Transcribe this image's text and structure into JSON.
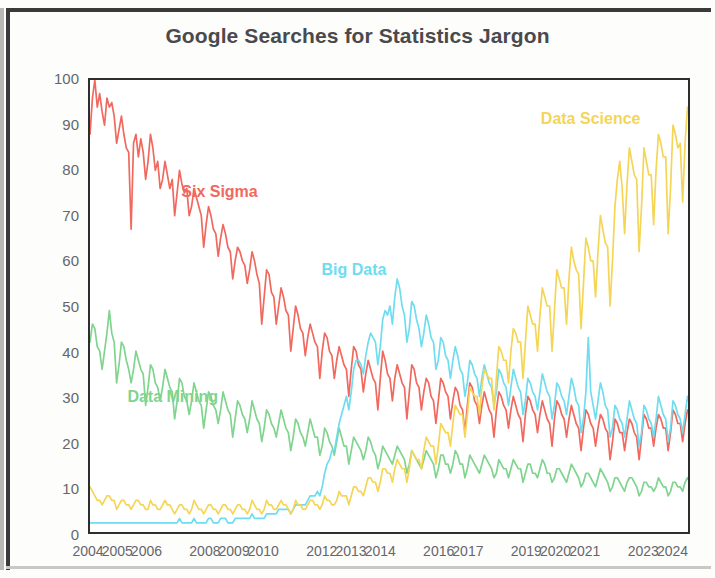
{
  "chart_data": {
    "type": "line",
    "title": "Google Searches for Statistics Jargon",
    "xlabel": "",
    "ylabel": "Estimated Number of Searches in U.S.",
    "ylim": [
      0,
      100
    ],
    "xlim": [
      2004,
      2024.6
    ],
    "grid": false,
    "legend_position": "inline-annotations",
    "y_ticks": [
      0,
      10,
      20,
      30,
      40,
      50,
      60,
      70,
      80,
      90,
      100
    ],
    "x_ticks": [
      2004,
      2005,
      2006,
      2008,
      2009,
      2010,
      2012,
      2013,
      2014,
      2016,
      2017,
      2019,
      2020,
      2021,
      2023,
      2024
    ],
    "x_tick_labels": [
      "2004",
      "2005",
      "2006",
      "2008",
      "2009",
      "2010",
      "2012",
      "2013",
      "2014",
      "2016",
      "2017",
      "2019",
      "2020",
      "2021",
      "2023",
      "2024"
    ],
    "sample_interval": "monthly",
    "x_start": 2004.0,
    "x_step": 0.08333,
    "series": [
      {
        "name": "Six Sigma",
        "color": "#f0685e",
        "label_x": 2008.5,
        "label_y": 75,
        "values": [
          88,
          96,
          100,
          94,
          97,
          93,
          90,
          96,
          94,
          95,
          92,
          86,
          89,
          92,
          88,
          85,
          84,
          67,
          86,
          88,
          83,
          87,
          84,
          78,
          82,
          88,
          85,
          80,
          82,
          76,
          78,
          82,
          79,
          76,
          78,
          70,
          75,
          80,
          77,
          75,
          76,
          70,
          72,
          76,
          74,
          72,
          70,
          63,
          68,
          72,
          70,
          67,
          66,
          61,
          65,
          68,
          66,
          63,
          62,
          56,
          60,
          63,
          62,
          60,
          59,
          55,
          58,
          62,
          60,
          57,
          55,
          46,
          52,
          58,
          57,
          53,
          52,
          46,
          50,
          54,
          52,
          49,
          48,
          40,
          45,
          50,
          48,
          45,
          44,
          39,
          43,
          46,
          44,
          42,
          41,
          34,
          40,
          44,
          43,
          40,
          39,
          34,
          38,
          41,
          39,
          37,
          36,
          30,
          36,
          41,
          40,
          37,
          36,
          31,
          35,
          38,
          36,
          34,
          33,
          27,
          34,
          40,
          38,
          35,
          34,
          29,
          34,
          37,
          35,
          33,
          32,
          25,
          31,
          37,
          36,
          33,
          32,
          27,
          31,
          34,
          33,
          30,
          29,
          24,
          29,
          34,
          33,
          31,
          30,
          25,
          29,
          32,
          31,
          28,
          27,
          22,
          28,
          33,
          32,
          29,
          28,
          24,
          28,
          31,
          29,
          27,
          26,
          21,
          27,
          31,
          30,
          28,
          27,
          23,
          27,
          30,
          28,
          26,
          25,
          20,
          26,
          30,
          29,
          27,
          26,
          22,
          26,
          29,
          27,
          25,
          24,
          19,
          25,
          29,
          28,
          26,
          25,
          21,
          25,
          28,
          26,
          24,
          23,
          18,
          23,
          27,
          26,
          24,
          23,
          19,
          23,
          26,
          25,
          23,
          22,
          16,
          20,
          25,
          24,
          22,
          22,
          18,
          22,
          25,
          24,
          22,
          21,
          16,
          21,
          26,
          25,
          23,
          23,
          19,
          23,
          26,
          25,
          23,
          23,
          18,
          22,
          27,
          26,
          24,
          24,
          20,
          24,
          27,
          26,
          24,
          25,
          25
        ]
      },
      {
        "name": "Data Mining",
        "color": "#7fd48e",
        "label_x": 2006.9,
        "label_y": 30,
        "values": [
          42,
          46,
          45,
          41,
          40,
          36,
          40,
          44,
          49,
          44,
          42,
          33,
          37,
          42,
          41,
          38,
          36,
          33,
          36,
          40,
          38,
          36,
          35,
          28,
          32,
          37,
          36,
          33,
          32,
          29,
          32,
          36,
          34,
          32,
          31,
          25,
          29,
          34,
          33,
          30,
          29,
          26,
          29,
          33,
          31,
          29,
          28,
          23,
          27,
          31,
          30,
          28,
          27,
          24,
          27,
          31,
          29,
          27,
          26,
          21,
          25,
          29,
          28,
          26,
          25,
          22,
          25,
          29,
          27,
          25,
          24,
          20,
          23,
          27,
          26,
          24,
          23,
          21,
          24,
          27,
          25,
          23,
          22,
          18,
          21,
          25,
          24,
          22,
          21,
          19,
          22,
          25,
          23,
          21,
          21,
          17,
          19,
          23,
          22,
          20,
          19,
          17,
          20,
          23,
          21,
          19,
          19,
          15,
          18,
          21,
          20,
          19,
          18,
          16,
          18,
          21,
          20,
          18,
          17,
          14,
          16,
          19,
          18,
          17,
          16,
          15,
          17,
          19,
          18,
          17,
          16,
          13,
          15,
          18,
          17,
          16,
          15,
          14,
          16,
          18,
          17,
          16,
          15,
          12,
          14,
          17,
          17,
          15,
          15,
          13,
          15,
          18,
          17,
          15,
          15,
          12,
          14,
          17,
          16,
          15,
          14,
          13,
          15,
          17,
          16,
          15,
          14,
          12,
          13,
          16,
          15,
          14,
          14,
          12,
          14,
          16,
          15,
          14,
          14,
          11,
          13,
          15,
          15,
          13,
          13,
          12,
          14,
          16,
          15,
          13,
          13,
          11,
          12,
          14,
          14,
          13,
          12,
          11,
          13,
          15,
          14,
          13,
          12,
          10,
          11,
          13,
          13,
          12,
          11,
          10,
          12,
          14,
          13,
          12,
          11,
          9,
          10,
          12,
          12,
          11,
          10,
          9,
          11,
          12,
          12,
          11,
          10,
          8,
          9,
          11,
          11,
          10,
          10,
          9,
          10,
          12,
          11,
          10,
          10,
          8,
          9,
          11,
          11,
          10,
          10,
          9,
          11,
          12,
          11,
          10,
          10,
          10
        ]
      },
      {
        "name": "Big Data",
        "color": "#6fdcf0",
        "label_x": 2013.1,
        "label_y": 58,
        "values": [
          2,
          2,
          2,
          2,
          2,
          2,
          2,
          2,
          2,
          2,
          2,
          2,
          2,
          2,
          2,
          2,
          2,
          2,
          2,
          2,
          2,
          2,
          2,
          2,
          2,
          2,
          2,
          2,
          2,
          2,
          2,
          2,
          2,
          2,
          2,
          2,
          2,
          3,
          2,
          2,
          2,
          2,
          2,
          3,
          2,
          2,
          2,
          2,
          2,
          3,
          3,
          2,
          2,
          2,
          3,
          3,
          3,
          2,
          2,
          2,
          3,
          3,
          3,
          3,
          3,
          3,
          3,
          4,
          3,
          3,
          3,
          3,
          3,
          4,
          4,
          4,
          4,
          4,
          5,
          5,
          5,
          5,
          5,
          4,
          5,
          6,
          6,
          6,
          6,
          6,
          7,
          8,
          8,
          8,
          9,
          8,
          10,
          13,
          15,
          16,
          18,
          18,
          21,
          24,
          26,
          28,
          30,
          27,
          31,
          36,
          38,
          38,
          37,
          35,
          39,
          42,
          44,
          43,
          42,
          37,
          41,
          47,
          49,
          48,
          50,
          46,
          52,
          56,
          54,
          50,
          48,
          42,
          45,
          51,
          50,
          47,
          45,
          41,
          44,
          48,
          46,
          43,
          42,
          36,
          38,
          43,
          42,
          39,
          38,
          34,
          38,
          41,
          39,
          36,
          35,
          30,
          33,
          38,
          37,
          35,
          34,
          30,
          34,
          37,
          35,
          33,
          32,
          28,
          31,
          36,
          35,
          33,
          32,
          28,
          32,
          36,
          34,
          32,
          31,
          26,
          29,
          34,
          33,
          31,
          30,
          27,
          31,
          35,
          33,
          31,
          30,
          25,
          28,
          33,
          32,
          30,
          29,
          26,
          30,
          34,
          32,
          29,
          28,
          22,
          25,
          31,
          43,
          31,
          28,
          25,
          29,
          33,
          31,
          28,
          27,
          21,
          23,
          28,
          27,
          25,
          24,
          21,
          25,
          29,
          27,
          25,
          24,
          19,
          22,
          28,
          27,
          25,
          24,
          21,
          25,
          30,
          28,
          26,
          25,
          20,
          23,
          29,
          28,
          26,
          25,
          22,
          26,
          30,
          28,
          26,
          26,
          26
        ]
      },
      {
        "name": "Data Science",
        "color": "#f5d556",
        "label_x": 2021.2,
        "label_y": 91,
        "values": [
          10,
          9,
          8,
          7,
          7,
          6,
          7,
          8,
          8,
          7,
          7,
          5,
          6,
          7,
          7,
          6,
          6,
          5,
          6,
          7,
          7,
          6,
          6,
          5,
          5,
          7,
          6,
          6,
          5,
          5,
          6,
          7,
          6,
          6,
          5,
          4,
          5,
          6,
          6,
          5,
          5,
          4,
          5,
          7,
          6,
          5,
          5,
          4,
          5,
          6,
          6,
          5,
          5,
          4,
          5,
          6,
          6,
          5,
          5,
          4,
          5,
          6,
          6,
          5,
          5,
          4,
          5,
          7,
          6,
          5,
          5,
          4,
          5,
          7,
          6,
          6,
          5,
          5,
          6,
          7,
          6,
          6,
          5,
          4,
          5,
          7,
          6,
          6,
          5,
          5,
          6,
          7,
          7,
          6,
          6,
          5,
          6,
          8,
          7,
          7,
          6,
          6,
          7,
          9,
          8,
          8,
          8,
          6,
          8,
          10,
          10,
          9,
          9,
          8,
          10,
          12,
          12,
          11,
          11,
          9,
          11,
          14,
          14,
          13,
          13,
          11,
          14,
          16,
          15,
          14,
          14,
          11,
          14,
          18,
          17,
          16,
          16,
          14,
          18,
          21,
          20,
          19,
          19,
          15,
          19,
          24,
          23,
          22,
          22,
          19,
          24,
          28,
          27,
          26,
          26,
          21,
          26,
          32,
          31,
          30,
          30,
          26,
          32,
          36,
          35,
          34,
          34,
          27,
          34,
          41,
          40,
          38,
          38,
          33,
          40,
          45,
          44,
          42,
          42,
          34,
          42,
          50,
          48,
          46,
          46,
          40,
          48,
          54,
          52,
          50,
          50,
          40,
          49,
          58,
          56,
          54,
          54,
          46,
          56,
          63,
          60,
          58,
          57,
          45,
          55,
          65,
          63,
          60,
          60,
          52,
          62,
          70,
          67,
          64,
          63,
          50,
          60,
          72,
          78,
          82,
          76,
          66,
          77,
          85,
          82,
          79,
          78,
          62,
          72,
          85,
          82,
          79,
          79,
          68,
          80,
          88,
          86,
          83,
          83,
          66,
          76,
          90,
          88,
          85,
          86,
          73,
          86,
          94,
          92,
          88,
          90,
          84
        ]
      }
    ]
  }
}
